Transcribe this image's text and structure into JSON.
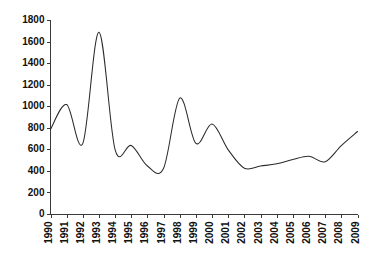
{
  "chart_data": {
    "type": "line",
    "title": "",
    "subtitle": "",
    "xlabel": "",
    "ylabel": "",
    "legend": [],
    "legend_position": "none",
    "grid": false,
    "xlim": [
      1990,
      2009
    ],
    "ylim": [
      0,
      1800
    ],
    "ytick_step": 200,
    "yticks": [
      0,
      200,
      400,
      600,
      800,
      1000,
      1200,
      1400,
      1600,
      1800
    ],
    "ytick_labels": [
      "0",
      "200",
      "400",
      "600",
      "800",
      "1000",
      "1200",
      "1400",
      "1600",
      "1800"
    ],
    "xticks": [
      1990,
      1991,
      1992,
      1993,
      1994,
      1995,
      1996,
      1997,
      1998,
      1999,
      2000,
      2001,
      2002,
      2003,
      2004,
      2005,
      2006,
      2007,
      2008,
      2009
    ],
    "xtick_labels": [
      "1990",
      "1991",
      "1992",
      "1993",
      "1994",
      "1995",
      "1996",
      "1997",
      "1998",
      "1999",
      "2000",
      "2001",
      "2002",
      "2003",
      "2004",
      "2005",
      "2006",
      "2007",
      "2008",
      "2009"
    ],
    "xtick_rotation": 90,
    "categories": [
      "1990",
      "1991",
      "1992",
      "1993",
      "1994",
      "1995",
      "1996",
      "1997",
      "1998",
      "1999",
      "2000",
      "2001",
      "2002",
      "2003",
      "2004",
      "2005",
      "2006",
      "2007",
      "2008",
      "2009"
    ],
    "x": [
      1990,
      1991,
      1992,
      1993,
      1994,
      1995,
      1996,
      1997,
      1998,
      1999,
      2000,
      2001,
      2002,
      2003,
      2004,
      2005,
      2006,
      2007,
      2008,
      2009
    ],
    "values": [
      790,
      1020,
      660,
      1690,
      600,
      640,
      450,
      430,
      1080,
      660,
      840,
      600,
      430,
      450,
      470,
      510,
      540,
      490,
      640,
      770
    ],
    "series": [
      {
        "name": "series-1",
        "color": "#2b2b2b",
        "values": [
          790,
          1020,
          660,
          1690,
          600,
          640,
          450,
          430,
          1080,
          660,
          840,
          600,
          430,
          450,
          470,
          510,
          540,
          490,
          640,
          770
        ]
      }
    ],
    "line_color": "#2b2b2b",
    "axis_color": "#3a3a3a",
    "background_color": "#ffffff",
    "smoothing": "spline"
  }
}
